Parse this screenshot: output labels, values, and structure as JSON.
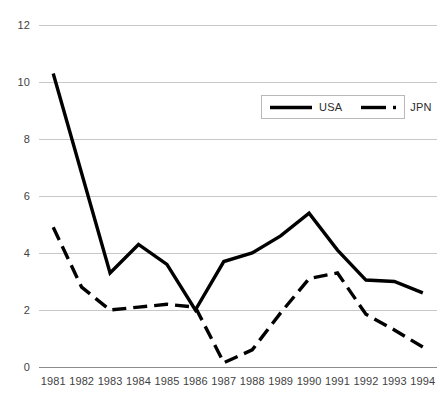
{
  "chart_data": {
    "type": "line",
    "title": "",
    "xlabel": "",
    "ylabel": "",
    "categories": [
      "1981",
      "1982",
      "1983",
      "1984",
      "1985",
      "1986",
      "1987",
      "1988",
      "1989",
      "1990",
      "1991",
      "1992",
      "1993",
      "1994"
    ],
    "x": [
      1981,
      1982,
      1983,
      1984,
      1985,
      1986,
      1987,
      1988,
      1989,
      1990,
      1991,
      1992,
      1993,
      1994
    ],
    "series": [
      {
        "name": "USA",
        "style": "solid",
        "color": "#000000",
        "values": [
          10.3,
          6.8,
          3.3,
          4.3,
          3.6,
          2.0,
          3.7,
          4.0,
          4.6,
          5.4,
          4.1,
          3.05,
          3.0,
          2.6
        ]
      },
      {
        "name": "JPN",
        "style": "dashed",
        "color": "#000000",
        "values": [
          4.9,
          2.8,
          2.0,
          2.1,
          2.2,
          2.1,
          0.15,
          0.6,
          1.9,
          3.1,
          3.3,
          1.85,
          1.3,
          0.7
        ]
      }
    ],
    "ylim": [
      0,
      12
    ],
    "yticks": [
      0,
      2,
      4,
      6,
      8,
      10,
      12
    ],
    "grid": true,
    "grid_color": "#c8c8c8",
    "legend": {
      "position": "upper-right-inside",
      "entries": [
        {
          "label": "USA",
          "style": "solid"
        },
        {
          "label": "JPN",
          "style": "dashed"
        }
      ]
    },
    "axes": {
      "x_axis_line": true,
      "x_axis_color": "#8c8c8c"
    }
  }
}
